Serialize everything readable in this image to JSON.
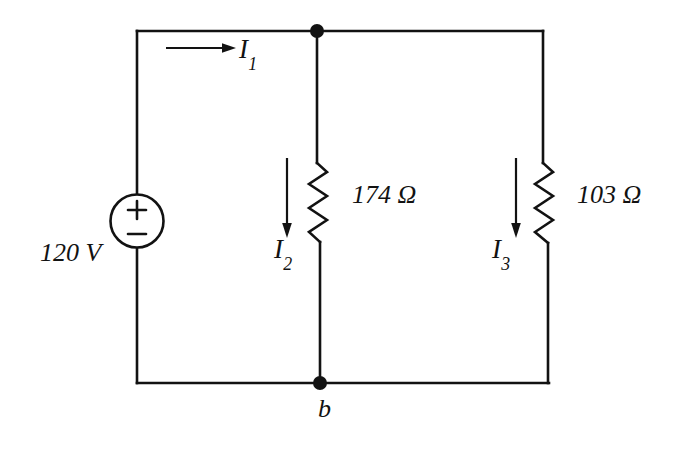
{
  "figure": {
    "type": "circuit-schematic",
    "background_color": "#ffffff",
    "ink_color": "#121212"
  },
  "source": {
    "label": "120 V",
    "polarity_plus": "+",
    "polarity_minus": "−",
    "symbol": "circle-source"
  },
  "resistors": [
    {
      "name": "middle-branch-resistor",
      "label": "174 Ω"
    },
    {
      "name": "right-branch-resistor",
      "label": "103 Ω"
    }
  ],
  "currents": [
    {
      "name": "current-1",
      "symbol": "I",
      "subscript": "1",
      "direction": "right"
    },
    {
      "name": "current-2",
      "symbol": "I",
      "subscript": "2",
      "direction": "down"
    },
    {
      "name": "current-3",
      "symbol": "I",
      "subscript": "3",
      "direction": "down"
    }
  ],
  "nodes": [
    {
      "name": "node-b",
      "label": "b"
    }
  ]
}
